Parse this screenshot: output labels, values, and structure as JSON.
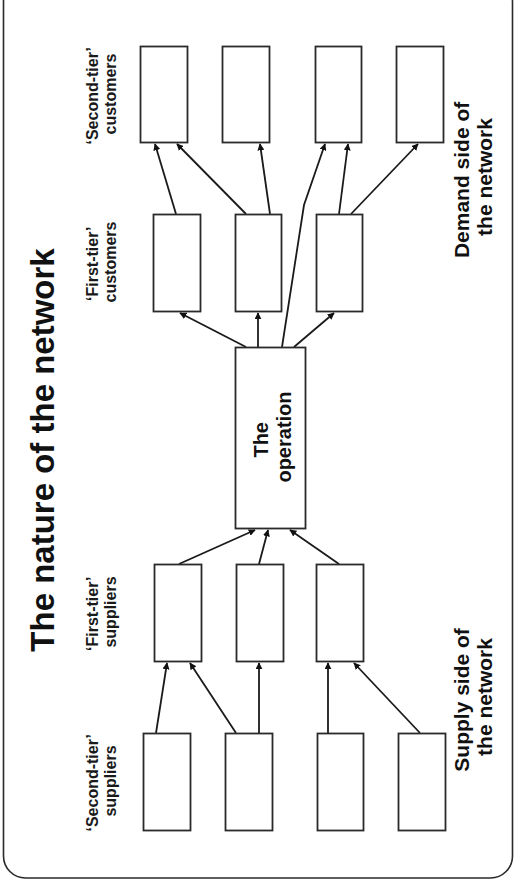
{
  "title": "The nature of the network",
  "labels": {
    "second_tier_customers": [
      "‘Second-tier’",
      "customers"
    ],
    "first_tier_customers": [
      "‘First-tier’",
      "customers"
    ],
    "first_tier_suppliers": [
      "‘First-tier’",
      "suppliers"
    ],
    "second_tier_suppliers": [
      "‘Second-tier’",
      "suppliers"
    ],
    "demand_side": [
      "Demand side of",
      "the network"
    ],
    "supply_side": [
      "Supply side of",
      "the network"
    ],
    "operation": [
      "The",
      "operation"
    ]
  },
  "colors": {
    "stroke": "#2a2a2a",
    "text": "#111111",
    "background": "#ffffff"
  },
  "nodes": {
    "second_tier_customers": [
      {
        "x": 140,
        "y": 46,
        "w": 47,
        "h": 96
      },
      {
        "x": 222,
        "y": 46,
        "w": 47,
        "h": 96
      },
      {
        "x": 315,
        "y": 46,
        "w": 46,
        "h": 96
      },
      {
        "x": 396,
        "y": 46,
        "w": 47,
        "h": 96
      }
    ],
    "first_tier_customers": [
      {
        "x": 153,
        "y": 214,
        "w": 47,
        "h": 97
      },
      {
        "x": 235,
        "y": 214,
        "w": 46,
        "h": 97
      },
      {
        "x": 316,
        "y": 214,
        "w": 46,
        "h": 97
      }
    ],
    "operation": {
      "x": 235,
      "y": 347,
      "w": 70,
      "h": 181
    },
    "first_tier_suppliers": [
      {
        "x": 154,
        "y": 564,
        "w": 47,
        "h": 97
      },
      {
        "x": 236,
        "y": 564,
        "w": 47,
        "h": 97
      },
      {
        "x": 316,
        "y": 564,
        "w": 47,
        "h": 97
      }
    ],
    "second_tier_suppliers": [
      {
        "x": 143,
        "y": 733,
        "w": 47,
        "h": 97
      },
      {
        "x": 225,
        "y": 733,
        "w": 47,
        "h": 97
      },
      {
        "x": 317,
        "y": 733,
        "w": 46,
        "h": 97
      },
      {
        "x": 398,
        "y": 733,
        "w": 47,
        "h": 97
      }
    ]
  },
  "edges": [
    {
      "from": "second_tier_supplier_1",
      "to": "first_tier_supplier_1",
      "points": [
        [
          156,
          733
        ],
        [
          167,
          663
        ]
      ]
    },
    {
      "from": "second_tier_supplier_2",
      "to": "first_tier_supplier_1",
      "points": [
        [
          236,
          733
        ],
        [
          190,
          663
        ]
      ]
    },
    {
      "from": "second_tier_supplier_2",
      "to": "first_tier_supplier_2",
      "points": [
        [
          259,
          733
        ],
        [
          259,
          663
        ]
      ]
    },
    {
      "from": "second_tier_supplier_3",
      "to": "first_tier_supplier_3",
      "points": [
        [
          328,
          733
        ],
        [
          328,
          663
        ]
      ]
    },
    {
      "from": "second_tier_supplier_4",
      "to": "first_tier_supplier_3",
      "points": [
        [
          420,
          733
        ],
        [
          354,
          663
        ]
      ]
    },
    {
      "from": "first_tier_supplier_1",
      "to": "operation",
      "points": [
        [
          179,
          564
        ],
        [
          255,
          530
        ]
      ]
    },
    {
      "from": "first_tier_supplier_2",
      "to": "operation",
      "points": [
        [
          259,
          564
        ],
        [
          268,
          530
        ]
      ]
    },
    {
      "from": "first_tier_supplier_3",
      "to": "operation",
      "points": [
        [
          339,
          564
        ],
        [
          290,
          530
        ]
      ]
    },
    {
      "from": "operation",
      "to": "first_tier_customer_1",
      "points": [
        [
          246,
          347
        ],
        [
          180,
          313
        ]
      ]
    },
    {
      "from": "operation",
      "to": "first_tier_customer_2",
      "points": [
        [
          258,
          347
        ],
        [
          258,
          313
        ]
      ]
    },
    {
      "from": "operation",
      "to": "first_tier_customer_3",
      "points": [
        [
          294,
          347
        ],
        [
          334,
          313
        ]
      ]
    },
    {
      "from": "operation",
      "to": "second_tier_customer_3",
      "points": [
        [
          282,
          347
        ],
        [
          304,
          205
        ],
        [
          325,
          144
        ]
      ]
    },
    {
      "from": "first_tier_customer_1",
      "to": "second_tier_customer_1",
      "points": [
        [
          176,
          214
        ],
        [
          155,
          144
        ]
      ]
    },
    {
      "from": "first_tier_customer_2",
      "to": "second_tier_customer_1",
      "points": [
        [
          246,
          214
        ],
        [
          177,
          144
        ]
      ]
    },
    {
      "from": "first_tier_customer_2",
      "to": "second_tier_customer_2",
      "points": [
        [
          270,
          214
        ],
        [
          260,
          144
        ]
      ]
    },
    {
      "from": "first_tier_customer_3",
      "to": "second_tier_customer_3",
      "points": [
        [
          339,
          214
        ],
        [
          348,
          144
        ]
      ]
    },
    {
      "from": "first_tier_customer_3",
      "to": "second_tier_customer_4",
      "points": [
        [
          351,
          214
        ],
        [
          418,
          144
        ]
      ]
    }
  ]
}
